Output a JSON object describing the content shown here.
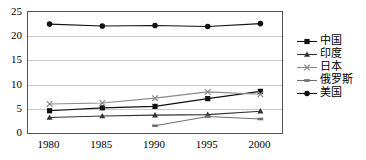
{
  "chart_data": {
    "type": "line",
    "title": "",
    "subtitle": "",
    "xlabel": "",
    "ylabel": "",
    "x": [
      1980,
      1985,
      1990,
      1995,
      2000
    ],
    "categories": [
      "1980",
      "1985",
      "1990",
      "1995",
      "2000"
    ],
    "ylim": [
      0,
      25
    ],
    "yticks": [
      0,
      5,
      10,
      15,
      20,
      25
    ],
    "ytick_labels": [
      "0",
      "5",
      "10",
      "15",
      "20",
      "25"
    ],
    "grid": true,
    "grid_axis": "y",
    "legend_position": "right",
    "series": [
      {
        "name": "中国",
        "marker": "square",
        "color": "#111111",
        "values": [
          4.6,
          5.2,
          5.5,
          7.1,
          8.6
        ]
      },
      {
        "name": "印度",
        "marker": "triangle",
        "color": "#333333",
        "values": [
          3.2,
          3.5,
          3.7,
          3.8,
          4.5
        ]
      },
      {
        "name": "日本",
        "marker": "x",
        "color": "#8a8a8a",
        "values": [
          6.0,
          6.2,
          7.2,
          8.5,
          8.0
        ]
      },
      {
        "name": "俄罗斯",
        "marker": "dash",
        "color": "#6f6f6f",
        "values": [
          null,
          null,
          1.5,
          3.4,
          2.9
        ]
      },
      {
        "name": "美国",
        "marker": "circle",
        "color": "#111111",
        "values": [
          22.5,
          22.1,
          22.2,
          22.0,
          22.6
        ]
      }
    ]
  },
  "legend": {
    "items": [
      {
        "label": "中国",
        "marker": "square-marker-icon"
      },
      {
        "label": "印度",
        "marker": "triangle-marker-icon"
      },
      {
        "label": "日本",
        "marker": "x-marker-icon"
      },
      {
        "label": "俄罗斯",
        "marker": "dash-marker-icon"
      },
      {
        "label": "美国",
        "marker": "circle-marker-icon"
      }
    ]
  }
}
